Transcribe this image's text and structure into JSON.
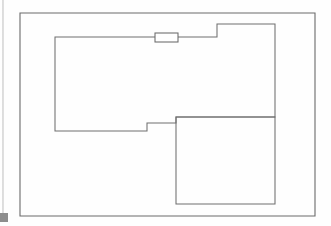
{
  "document": {
    "kind": "architectural-floor-plan-sketch",
    "title": "Floor plan line drawing",
    "background_color": "#fefefe",
    "line_color": "#6a6a6a",
    "line_width": 1,
    "canvas": {
      "width": 331,
      "height": 226
    }
  },
  "plan": {
    "outer_boundary": {
      "name": "site-boundary-rectangle",
      "x": 20,
      "y": 13,
      "width": 295,
      "height": 203,
      "points": "20,13 315,13 315,216 20,216 20,13"
    },
    "main_outline": {
      "name": "building-outline-polygon",
      "points": "55,37 155,37 178,37 217,37 217,24 275,24 275,117 176,117 176,123 147,123 147,131 55,131 55,37"
    },
    "interior_room": {
      "name": "interior-room-rectangle",
      "x": 176,
      "y": 117,
      "width": 99,
      "height": 87,
      "points": "176,117 275,117 275,204 176,204 176,117"
    },
    "door_opening": {
      "name": "door-opening-symbol",
      "x": 155,
      "y": 33,
      "width": 23,
      "height": 9
    },
    "scan_artifacts": [
      {
        "name": "scan-left-edge-strip",
        "x": 2,
        "y": 0,
        "width": 2,
        "height": 214
      },
      {
        "name": "scan-corner-mark",
        "x": 0,
        "y": 213,
        "width": 8,
        "height": 9
      }
    ]
  }
}
